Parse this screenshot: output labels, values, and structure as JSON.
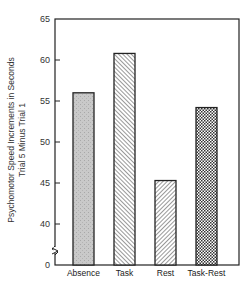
{
  "chart_data": {
    "type": "bar",
    "title": "",
    "categories": [
      "Absence",
      "Task",
      "Rest",
      "Task-Rest"
    ],
    "values": [
      56.0,
      60.8,
      45.3,
      54.2
    ],
    "xlabel": "",
    "ylabel": [
      "Psychomotor Speed Increments in Seconds",
      "Trial 5 Minus Trial 1"
    ],
    "yticks": [
      0,
      40,
      45,
      50,
      55,
      60,
      65
    ],
    "ylim": [
      0,
      65
    ],
    "axis_break": "between 0 and 40",
    "grid": false,
    "legend": null,
    "bar_fills": [
      "stipple-gray",
      "diagonal-hatch-left",
      "diagonal-hatch-right",
      "crosshatch"
    ]
  }
}
